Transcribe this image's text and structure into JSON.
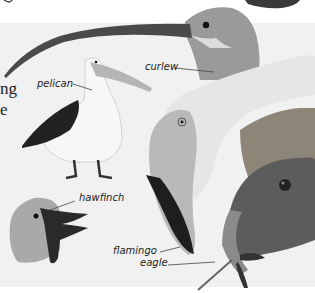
{
  "page": {
    "fragment_top": "g",
    "body_text_lines": [
      "ng",
      "e"
    ]
  },
  "labels": {
    "curlew": "curlew",
    "pelican": "pelican",
    "hawfinch": "hawfinch",
    "flamingo": "flamingo",
    "eagle": "eagle"
  },
  "colors": {
    "panel_bg": "#f1f1f1",
    "page_bg": "#ffffff",
    "ink": "#222222"
  }
}
